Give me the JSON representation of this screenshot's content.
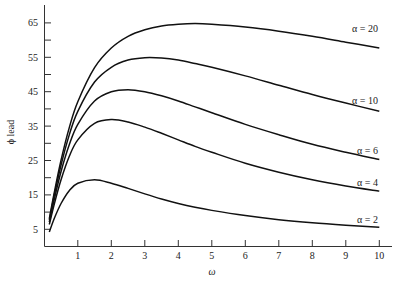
{
  "chart_data": {
    "type": "line",
    "title": "",
    "xlabel": "ω",
    "ylabel": "ϕ lead",
    "xlim": [
      0,
      10.4
    ],
    "ylim": [
      0,
      70
    ],
    "x_ticks": [
      1,
      2,
      3,
      4,
      5,
      6,
      7,
      8,
      9,
      10
    ],
    "y_ticks": [
      5,
      15,
      25,
      35,
      45,
      55,
      65
    ],
    "y_minor_ticks": [
      10,
      20,
      30,
      40,
      50,
      60
    ],
    "grid": false,
    "legend": "inline labels at right end of each curve",
    "x": [
      0.15,
      0.3,
      0.5,
      0.75,
      1,
      1.5,
      2,
      2.5,
      3,
      3.5,
      4,
      4.5,
      5,
      6,
      7,
      8,
      9,
      10
    ],
    "series": [
      {
        "name": "α = 20",
        "alpha": 20,
        "label_y": 62.5,
        "values": [
          8.1,
          15.8,
          25.1,
          34.7,
          42.1,
          52.0,
          57.7,
          61.1,
          63.0,
          64.1,
          64.6,
          64.8,
          64.6,
          63.8,
          62.6,
          61.1,
          59.4,
          57.7
        ]
      },
      {
        "name": "α = 10",
        "alpha": 10,
        "label_y": 41.3,
        "values": [
          7.7,
          15.0,
          23.7,
          32.6,
          39.3,
          47.8,
          52.1,
          54.2,
          54.9,
          54.8,
          54.2,
          53.2,
          52.1,
          49.6,
          46.9,
          44.2,
          41.7,
          39.3
        ]
      },
      {
        "name": "α = 6",
        "alpha": 6,
        "label_y": 27.0,
        "values": [
          7.1,
          13.8,
          21.8,
          29.7,
          35.5,
          42.3,
          45.0,
          45.6,
          45.0,
          43.8,
          42.3,
          40.6,
          38.9,
          35.5,
          32.5,
          29.7,
          27.4,
          25.3
        ]
      },
      {
        "name": "α = 4",
        "alpha": 4,
        "label_y": 17.7,
        "values": [
          6.4,
          12.4,
          19.4,
          26.3,
          31.0,
          35.8,
          36.9,
          36.2,
          34.7,
          32.9,
          31.0,
          29.1,
          27.4,
          24.2,
          21.6,
          19.4,
          17.6,
          16.1
        ]
      },
      {
        "name": "α = 2",
        "alpha": 2,
        "label_y": 6.9,
        "values": [
          4.2,
          8.2,
          12.5,
          16.3,
          18.4,
          19.4,
          18.4,
          16.9,
          15.3,
          13.8,
          12.5,
          11.4,
          10.5,
          9.0,
          7.8,
          6.9,
          6.2,
          5.6
        ]
      }
    ]
  },
  "colors": {
    "line": "#111111",
    "axis": "#333333",
    "text": "#222222",
    "background": "#ffffff"
  }
}
